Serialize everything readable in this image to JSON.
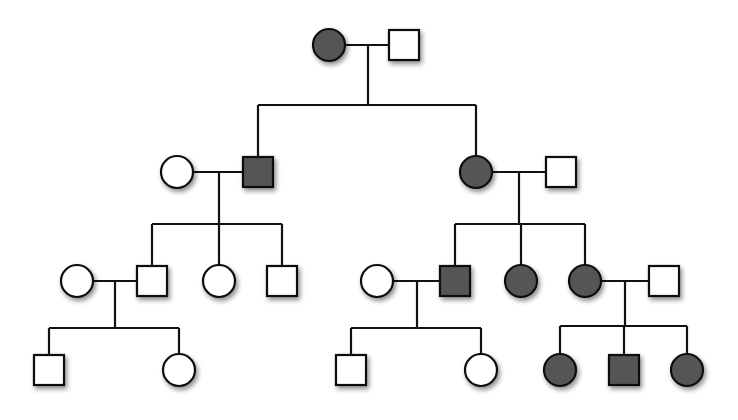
{
  "diagram": {
    "type": "pedigree",
    "colors": {
      "affected": "#555555",
      "unaffected": "#ffffff",
      "stroke": "#111111",
      "background": "#ffffff"
    },
    "size": 30,
    "individuals": [
      {
        "id": "I-1",
        "gen": 1,
        "sex": "female",
        "affected": true,
        "cx": 329,
        "cy": 45
      },
      {
        "id": "I-2",
        "gen": 1,
        "sex": "male",
        "affected": false,
        "cx": 404,
        "cy": 45
      },
      {
        "id": "II-1",
        "gen": 2,
        "sex": "female",
        "affected": false,
        "cx": 177,
        "cy": 172
      },
      {
        "id": "II-2",
        "gen": 2,
        "sex": "male",
        "affected": true,
        "cx": 258,
        "cy": 172
      },
      {
        "id": "II-3",
        "gen": 2,
        "sex": "female",
        "affected": true,
        "cx": 476,
        "cy": 172
      },
      {
        "id": "II-4",
        "gen": 2,
        "sex": "male",
        "affected": false,
        "cx": 561,
        "cy": 172
      },
      {
        "id": "III-1",
        "gen": 3,
        "sex": "female",
        "affected": false,
        "cx": 77,
        "cy": 281
      },
      {
        "id": "III-2",
        "gen": 3,
        "sex": "male",
        "affected": false,
        "cx": 152,
        "cy": 281
      },
      {
        "id": "III-3",
        "gen": 3,
        "sex": "female",
        "affected": false,
        "cx": 219,
        "cy": 281
      },
      {
        "id": "III-4",
        "gen": 3,
        "sex": "male",
        "affected": false,
        "cx": 282,
        "cy": 281
      },
      {
        "id": "III-5",
        "gen": 3,
        "sex": "female",
        "affected": false,
        "cx": 377,
        "cy": 281
      },
      {
        "id": "III-6",
        "gen": 3,
        "sex": "male",
        "affected": true,
        "cx": 455,
        "cy": 281
      },
      {
        "id": "III-7",
        "gen": 3,
        "sex": "female",
        "affected": true,
        "cx": 521,
        "cy": 281
      },
      {
        "id": "III-8",
        "gen": 3,
        "sex": "female",
        "affected": true,
        "cx": 585,
        "cy": 281
      },
      {
        "id": "III-9",
        "gen": 3,
        "sex": "male",
        "affected": false,
        "cx": 664,
        "cy": 281
      },
      {
        "id": "IV-1",
        "gen": 4,
        "sex": "male",
        "affected": false,
        "cx": 49,
        "cy": 370
      },
      {
        "id": "IV-2",
        "gen": 4,
        "sex": "female",
        "affected": false,
        "cx": 179,
        "cy": 370
      },
      {
        "id": "IV-3",
        "gen": 4,
        "sex": "male",
        "affected": false,
        "cx": 351,
        "cy": 370
      },
      {
        "id": "IV-4",
        "gen": 4,
        "sex": "female",
        "affected": false,
        "cx": 481,
        "cy": 370
      },
      {
        "id": "IV-5",
        "gen": 4,
        "sex": "female",
        "affected": true,
        "cx": 560,
        "cy": 370
      },
      {
        "id": "IV-6",
        "gen": 4,
        "sex": "male",
        "affected": true,
        "cx": 624,
        "cy": 370
      },
      {
        "id": "IV-7",
        "gen": 4,
        "sex": "female",
        "affected": true,
        "cx": 687,
        "cy": 370
      }
    ],
    "matings": [
      {
        "id": "m1",
        "partners": [
          "I-1",
          "I-2"
        ],
        "y": 45,
        "x1": 345,
        "x2": 389,
        "drop_x": 368,
        "sibship_y": 105,
        "sib_x1": 258,
        "sib_x2": 476,
        "children": [
          "II-2",
          "II-3"
        ]
      },
      {
        "id": "m2",
        "partners": [
          "II-1",
          "II-2"
        ],
        "y": 172,
        "x1": 193,
        "x2": 243,
        "drop_x": 219,
        "sibship_y": 224,
        "sib_x1": 152,
        "sib_x2": 282,
        "children": [
          "III-2",
          "III-3",
          "III-4"
        ]
      },
      {
        "id": "m3",
        "partners": [
          "II-3",
          "II-4"
        ],
        "y": 172,
        "x1": 492,
        "x2": 546,
        "drop_x": 519,
        "sibship_y": 224,
        "sib_x1": 455,
        "sib_x2": 585,
        "children": [
          "III-6",
          "III-7",
          "III-8"
        ]
      },
      {
        "id": "m4",
        "partners": [
          "III-1",
          "III-2"
        ],
        "y": 281,
        "x1": 93,
        "x2": 137,
        "drop_x": 115,
        "sibship_y": 328,
        "sib_x1": 49,
        "sib_x2": 179,
        "children": [
          "IV-1",
          "IV-2"
        ]
      },
      {
        "id": "m5",
        "partners": [
          "III-5",
          "III-6"
        ],
        "y": 281,
        "x1": 393,
        "x2": 440,
        "drop_x": 417,
        "sibship_y": 328,
        "sib_x1": 351,
        "sib_x2": 481,
        "children": [
          "IV-3",
          "IV-4"
        ]
      },
      {
        "id": "m6",
        "partners": [
          "III-8",
          "III-9"
        ],
        "y": 281,
        "x1": 601,
        "x2": 649,
        "drop_x": 625,
        "sibship_y": 326,
        "sib_x1": 560,
        "sib_x2": 687,
        "children": [
          "IV-5",
          "IV-6",
          "IV-7"
        ]
      }
    ]
  }
}
